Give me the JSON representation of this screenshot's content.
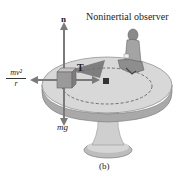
{
  "figure": {
    "title": "Noninertial observer",
    "caption": "(b)",
    "labels": {
      "normal_force": "n",
      "tension": "T",
      "weight": "mg",
      "centrifugal_numerator": "mv²",
      "centrifugal_denominator": "r"
    },
    "colors": {
      "table_top": "#d8d8d8",
      "table_edge": "#a9a9a9",
      "pedestal": "#c9c9c9",
      "block": "#9a9a9a",
      "arrow": "#7a7a7a",
      "tension_shadow": "#6e6e6e"
    }
  }
}
